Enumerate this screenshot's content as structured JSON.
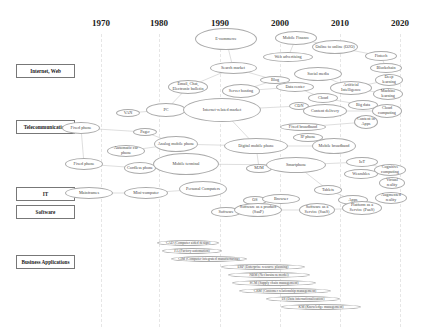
{
  "years": [
    {
      "label": "1970",
      "x": 101
    },
    {
      "label": "1980",
      "x": 159
    },
    {
      "label": "1990",
      "x": 220
    },
    {
      "label": "2000",
      "x": 280
    },
    {
      "label": "2010",
      "x": 340
    },
    {
      "label": "2020",
      "x": 400
    }
  ],
  "categories": [
    {
      "label": "Internet, Web",
      "y": 71
    },
    {
      "label": "Telecommunication",
      "y": 127
    },
    {
      "label": "IT",
      "y": 194
    },
    {
      "label": "Software",
      "y": 212
    },
    {
      "label": "Business Applications",
      "y": 262
    }
  ],
  "nodes": [
    {
      "id": "ecommerce",
      "label": "E-commerce",
      "x": 226,
      "y": 39,
      "w": 62,
      "h": 22
    },
    {
      "id": "mobile_finance",
      "label": "Mobile Finance",
      "x": 296,
      "y": 38,
      "w": 42,
      "h": 14
    },
    {
      "id": "o2o",
      "label": "Online to online (O2O)",
      "x": 335,
      "y": 47,
      "w": 46,
      "h": 14
    },
    {
      "id": "web_ad",
      "label": "Web advertising",
      "x": 288,
      "y": 57,
      "w": 50,
      "h": 10
    },
    {
      "id": "fintech",
      "label": "Fintech",
      "x": 381,
      "y": 56,
      "w": 32,
      "h": 10
    },
    {
      "id": "search_market",
      "label": "Search market",
      "x": 233,
      "y": 68,
      "w": 47,
      "h": 12
    },
    {
      "id": "blockchain",
      "label": "Blockchain",
      "x": 386,
      "y": 68,
      "w": 32,
      "h": 10
    },
    {
      "id": "social_media",
      "label": "Social media",
      "x": 318,
      "y": 74,
      "w": 48,
      "h": 14
    },
    {
      "id": "blog",
      "label": "Blog",
      "x": 275,
      "y": 80,
      "w": 30,
      "h": 8
    },
    {
      "id": "email",
      "label": "Email, Chat, Electronic bulletin",
      "x": 188,
      "y": 87,
      "w": 40,
      "h": 14
    },
    {
      "id": "server_hosting",
      "label": "Server hosting",
      "x": 241,
      "y": 91,
      "w": 38,
      "h": 14
    },
    {
      "id": "data_center",
      "label": "Data center",
      "x": 295,
      "y": 87,
      "w": 38,
      "h": 10
    },
    {
      "id": "ai",
      "label": "Artificial Intelligence",
      "x": 351,
      "y": 88,
      "w": 42,
      "h": 14
    },
    {
      "id": "deep_learning",
      "label": "Deep learning",
      "x": 389,
      "y": 80,
      "w": 28,
      "h": 12
    },
    {
      "id": "machine_learning",
      "label": "Machine learning",
      "x": 388,
      "y": 94,
      "w": 30,
      "h": 12
    },
    {
      "id": "cloud",
      "label": "Cloud",
      "x": 323,
      "y": 98,
      "w": 30,
      "h": 10
    },
    {
      "id": "big_data",
      "label": "Big data",
      "x": 363,
      "y": 105,
      "w": 30,
      "h": 10
    },
    {
      "id": "cdn",
      "label": "CDN",
      "x": 299,
      "y": 106,
      "w": 20,
      "h": 8
    },
    {
      "id": "van",
      "label": "VAN",
      "x": 128,
      "y": 113,
      "w": 24,
      "h": 8
    },
    {
      "id": "pc",
      "label": "PC",
      "x": 166,
      "y": 110,
      "w": 40,
      "h": 14
    },
    {
      "id": "internet_market",
      "label": "Internet-related market",
      "x": 222,
      "y": 110,
      "w": 78,
      "h": 24
    },
    {
      "id": "content_delivery",
      "label": "Content delivery",
      "x": 325,
      "y": 111,
      "w": 44,
      "h": 14
    },
    {
      "id": "cloud_computing",
      "label": "Cloud computing",
      "x": 387,
      "y": 111,
      "w": 30,
      "h": 14
    },
    {
      "id": "fixed_phone_1",
      "label": "Fixed phone",
      "x": 81,
      "y": 128,
      "w": 38,
      "h": 12
    },
    {
      "id": "pager",
      "label": "Pager",
      "x": 145,
      "y": 132,
      "w": 24,
      "h": 8
    },
    {
      "id": "fixed_broadband",
      "label": "Fixed broadband",
      "x": 303,
      "y": 127,
      "w": 46,
      "h": 8
    },
    {
      "id": "content_apps",
      "label": "Content in Apps",
      "x": 366,
      "y": 122,
      "w": 24,
      "h": 14
    },
    {
      "id": "analog_mobile",
      "label": "Analog mobile phone",
      "x": 176,
      "y": 144,
      "w": 44,
      "h": 16
    },
    {
      "id": "ip_phone",
      "label": "IP phone",
      "x": 308,
      "y": 137,
      "w": 30,
      "h": 9
    },
    {
      "id": "digital_mobile",
      "label": "Digital mobile phone",
      "x": 256,
      "y": 146,
      "w": 64,
      "h": 16
    },
    {
      "id": "mobile_broadband",
      "label": "Mobile broadband",
      "x": 334,
      "y": 146,
      "w": 44,
      "h": 16
    },
    {
      "id": "auto_car_phone",
      "label": "Automatic car phone",
      "x": 126,
      "y": 151,
      "w": 38,
      "h": 12
    },
    {
      "id": "fixed_phone_2",
      "label": "Fixed phone",
      "x": 84,
      "y": 164,
      "w": 38,
      "h": 12
    },
    {
      "id": "cordless",
      "label": "Cordless phone",
      "x": 140,
      "y": 168,
      "w": 32,
      "h": 12
    },
    {
      "id": "mobile_terminal",
      "label": "Mobile terminal",
      "x": 186,
      "y": 164,
      "w": 66,
      "h": 22
    },
    {
      "id": "m2m",
      "label": "M2M",
      "x": 259,
      "y": 168,
      "w": 26,
      "h": 9
    },
    {
      "id": "smartphone",
      "label": "Smartphone",
      "x": 296,
      "y": 165,
      "w": 60,
      "h": 16
    },
    {
      "id": "iot",
      "label": "IoT",
      "x": 362,
      "y": 162,
      "w": 32,
      "h": 10
    },
    {
      "id": "cognitive",
      "label": "Cognitive computing",
      "x": 390,
      "y": 170,
      "w": 32,
      "h": 12
    },
    {
      "id": "wearables",
      "label": "Wearables",
      "x": 361,
      "y": 174,
      "w": 34,
      "h": 10
    },
    {
      "id": "virtual_reality",
      "label": "Virtual reality",
      "x": 392,
      "y": 183,
      "w": 26,
      "h": 12
    },
    {
      "id": "mainframes",
      "label": "Mainframes",
      "x": 89,
      "y": 193,
      "w": 48,
      "h": 12
    },
    {
      "id": "mini_computer",
      "label": "Mini-computer",
      "x": 146,
      "y": 193,
      "w": 44,
      "h": 12
    },
    {
      "id": "personal_computers",
      "label": "Personal Computers",
      "x": 203,
      "y": 189,
      "w": 48,
      "h": 16
    },
    {
      "id": "tablets",
      "label": "Tablets",
      "x": 328,
      "y": 190,
      "w": 28,
      "h": 10
    },
    {
      "id": "apps",
      "label": "Apps",
      "x": 353,
      "y": 200,
      "w": 30,
      "h": 10
    },
    {
      "id": "augmented_reality",
      "label": "Augmented reality",
      "x": 391,
      "y": 198,
      "w": 32,
      "h": 12
    },
    {
      "id": "os",
      "label": "OS",
      "x": 255,
      "y": 200,
      "w": 24,
      "h": 9
    },
    {
      "id": "browser",
      "label": "Browser",
      "x": 281,
      "y": 199,
      "w": 38,
      "h": 10
    },
    {
      "id": "software",
      "label": "Software",
      "x": 226,
      "y": 212,
      "w": 30,
      "h": 10
    },
    {
      "id": "software_product",
      "label": "Software as a product (SaaP)",
      "x": 258,
      "y": 210,
      "w": 48,
      "h": 14
    },
    {
      "id": "saas",
      "label": "Software as a Service (SaaS)",
      "x": 317,
      "y": 210,
      "w": 36,
      "h": 14
    },
    {
      "id": "paas",
      "label": "Platform as a Service (PaaS)",
      "x": 362,
      "y": 208,
      "w": 40,
      "h": 14
    }
  ],
  "edges": [
    [
      "van",
      "pc"
    ],
    [
      "pc",
      "internet_market"
    ],
    [
      "pc",
      "email"
    ],
    [
      "email",
      "search_market"
    ],
    [
      "search_market",
      "ecommerce"
    ],
    [
      "search_market",
      "blog"
    ],
    [
      "blog",
      "server_hosting"
    ],
    [
      "server_hosting",
      "data_center"
    ],
    [
      "data_center",
      "cloud"
    ],
    [
      "cloud",
      "big_data"
    ],
    [
      "ai",
      "deep_learning"
    ],
    [
      "ai",
      "machine_learning"
    ],
    [
      "social_media",
      "ai"
    ],
    [
      "web_ad",
      "mobile_finance"
    ],
    [
      "mobile_finance",
      "o2o"
    ],
    [
      "o2o",
      "fintech"
    ],
    [
      "fintech",
      "blockchain"
    ],
    [
      "internet_market",
      "cdn"
    ],
    [
      "cdn",
      "content_delivery"
    ],
    [
      "content_delivery",
      "cloud_computing"
    ],
    [
      "fixed_broadband",
      "content_apps"
    ],
    [
      "fixed_phone_1",
      "pager"
    ],
    [
      "fixed_phone_1",
      "fixed_phone_2"
    ],
    [
      "pager",
      "analog_mobile"
    ],
    [
      "auto_car_phone",
      "analog_mobile"
    ],
    [
      "fixed_phone_2",
      "cordless"
    ],
    [
      "analog_mobile",
      "digital_mobile"
    ],
    [
      "digital_mobile",
      "mobile_broadband"
    ],
    [
      "digital_mobile",
      "m2m"
    ],
    [
      "m2m",
      "smartphone"
    ],
    [
      "smartphone",
      "iot"
    ],
    [
      "smartphone",
      "tablets"
    ],
    [
      "iot",
      "cognitive"
    ],
    [
      "mainframes",
      "mini_computer"
    ],
    [
      "mini_computer",
      "personal_computers"
    ],
    [
      "os",
      "browser"
    ],
    [
      "software",
      "software_product"
    ],
    [
      "software_product",
      "saas"
    ],
    [
      "saas",
      "paas"
    ],
    [
      "tablets",
      "apps"
    ],
    [
      "mobile_terminal",
      "smartphone"
    ],
    [
      "internet_market",
      "digital_mobile"
    ]
  ],
  "business_apps": [
    {
      "label": "CAD (Computer aided design)",
      "x": 157,
      "y": 243,
      "w": 62
    },
    {
      "label": "FA (Factory automation)",
      "x": 162,
      "y": 251,
      "w": 60
    },
    {
      "label": "CIM (Computer integrated manufacturing)",
      "x": 171,
      "y": 259,
      "w": 76
    },
    {
      "label": "ERP (Enterprise resource planning)",
      "x": 221,
      "y": 267,
      "w": 84
    },
    {
      "label": "NBM (Net business model)",
      "x": 228,
      "y": 275,
      "w": 82
    },
    {
      "label": "SCM (Supply chain management)",
      "x": 232,
      "y": 283,
      "w": 84
    },
    {
      "label": "CRM (Customer relationship management)",
      "x": 239,
      "y": 291,
      "w": 92
    },
    {
      "label": "DI (Data internationalization)",
      "x": 266,
      "y": 299,
      "w": 74
    },
    {
      "label": "KM (Knowledge management)",
      "x": 281,
      "y": 307,
      "w": 80
    }
  ]
}
